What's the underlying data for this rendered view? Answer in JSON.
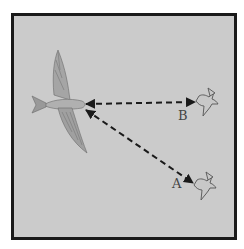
{
  "diagram": {
    "nodes": [
      {
        "id": "large-bird",
        "label": ""
      },
      {
        "id": "bird-b",
        "label": "B"
      },
      {
        "id": "bird-a",
        "label": "A"
      }
    ],
    "edges": [
      {
        "from": "large-bird",
        "to": "bird-b",
        "style": "dashed",
        "arrows": "both"
      },
      {
        "from": "large-bird",
        "to": "bird-a",
        "style": "dashed",
        "arrows": "both"
      }
    ],
    "colors": {
      "background": "#cbcbcb",
      "border": "#1a1a1a",
      "line": "#1a1a1a"
    }
  },
  "labels": {
    "a": "A",
    "b": "B"
  }
}
